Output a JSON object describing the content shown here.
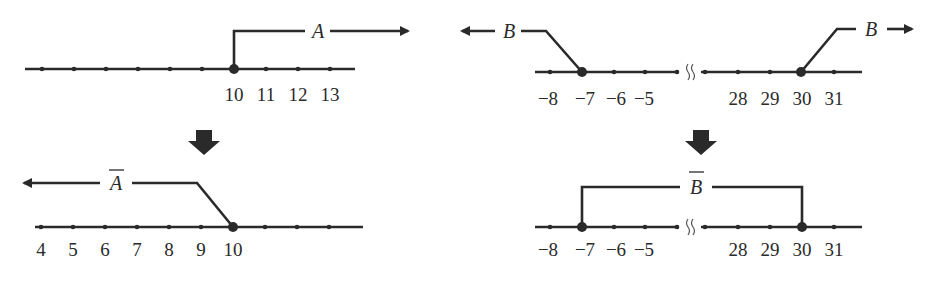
{
  "colors": {
    "ink": "#2a2a2a",
    "background": "#ffffff"
  },
  "panels": {
    "top_left": {
      "set_label": "A",
      "complement": false,
      "tick_labels": [
        "10",
        "11",
        "12",
        "13"
      ],
      "boundary_point": "10",
      "boundary_filled": true,
      "direction": "right"
    },
    "bottom_left": {
      "set_label": "A",
      "complement": true,
      "tick_labels": [
        "4",
        "5",
        "6",
        "7",
        "8",
        "9",
        "10"
      ],
      "boundary_point": "10",
      "boundary_filled": true,
      "direction": "left"
    },
    "top_right": {
      "set_label": "B",
      "complement": false,
      "tick_labels_left": [
        "−8",
        "−7",
        "−6",
        "−5"
      ],
      "tick_labels_right": [
        "28",
        "29",
        "30",
        "31"
      ],
      "boundary_points": [
        "−7",
        "30"
      ],
      "boundary_filled": true,
      "directions": [
        "left",
        "right"
      ],
      "axis_break": true
    },
    "bottom_right": {
      "set_label": "B",
      "complement": true,
      "tick_labels_left": [
        "−8",
        "−7",
        "−6",
        "−5"
      ],
      "tick_labels_right": [
        "28",
        "29",
        "30",
        "31"
      ],
      "boundary_points": [
        "−7",
        "30"
      ],
      "boundary_filled": true,
      "axis_break": true
    }
  },
  "transition_arrows": [
    {
      "from": "top_left",
      "to": "bottom_left",
      "icon": "down-arrow-icon"
    },
    {
      "from": "top_right",
      "to": "bottom_right",
      "icon": "down-arrow-icon"
    }
  ]
}
